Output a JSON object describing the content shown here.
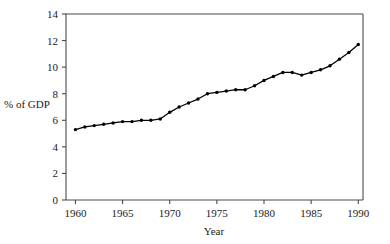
{
  "chart_data": {
    "type": "line",
    "title": "",
    "xlabel": "Year",
    "ylabel": "% of GDP",
    "xlim": [
      1959,
      1990.5
    ],
    "ylim": [
      0,
      14
    ],
    "xticks": [
      1960,
      1965,
      1970,
      1975,
      1980,
      1985,
      1990
    ],
    "yticks": [
      0,
      2,
      4,
      6,
      8,
      10,
      12,
      14
    ],
    "grid": false,
    "legend": null,
    "marker": "filled-circle",
    "x": [
      1960,
      1961,
      1962,
      1963,
      1964,
      1965,
      1966,
      1967,
      1968,
      1969,
      1970,
      1971,
      1972,
      1973,
      1974,
      1975,
      1976,
      1977,
      1978,
      1979,
      1980,
      1981,
      1982,
      1983,
      1984,
      1985,
      1986,
      1987,
      1988,
      1989,
      1990
    ],
    "values": [
      5.3,
      5.5,
      5.6,
      5.7,
      5.8,
      5.9,
      5.9,
      6.0,
      6.0,
      6.1,
      6.6,
      7.0,
      7.3,
      7.6,
      8.0,
      8.1,
      8.2,
      8.3,
      8.3,
      8.6,
      9.0,
      9.3,
      9.6,
      9.6,
      9.4,
      9.6,
      9.8,
      10.1,
      10.6,
      11.1,
      11.7
    ],
    "axis_style": {
      "x_axis_position": "bottom",
      "y_axis_position": "left",
      "box": false,
      "top_rule": true,
      "right_rule": true
    }
  },
  "labels": {
    "y_axis_title": "% of GDP",
    "x_axis_title": "Year",
    "y_tick_labels": [
      "0",
      "2",
      "4",
      "6",
      "8",
      "10",
      "12",
      "14"
    ],
    "x_tick_labels": [
      "1960",
      "1965",
      "1970",
      "1975",
      "1980",
      "1985",
      "1990"
    ]
  },
  "colors": {
    "line": "#000000",
    "marker": "#000000",
    "axis": "#4a4a4a",
    "text": "#1a1a1a",
    "background": "#ffffff"
  }
}
